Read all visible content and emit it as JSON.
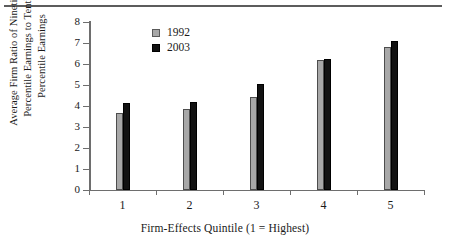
{
  "chart_data": {
    "type": "bar",
    "title": "",
    "xlabel": "Firm-Effects Quintile (1 = Highest)",
    "ylabel": "Average Firm Ratio of Ninetieth Percentile Earnings to Tenth Percentile Earnings",
    "ylabel_lines": [
      "Average Firm Ratio of Ninetieth",
      "Percentile Earnings to Tenth",
      "Percentile Earnings"
    ],
    "categories": [
      "1",
      "2",
      "3",
      "4",
      "5"
    ],
    "series": [
      {
        "name": "1992",
        "color": "#a8a8a8",
        "values": [
          3.65,
          3.85,
          4.45,
          6.18,
          6.82
        ]
      },
      {
        "name": "2003",
        "color": "#121212",
        "values": [
          4.15,
          4.2,
          5.05,
          6.25,
          7.08
        ]
      }
    ],
    "ylim": [
      0,
      8
    ],
    "ytick_labels": [
      "0",
      "1",
      "2",
      "3",
      "4",
      "5",
      "6",
      "7",
      "8"
    ],
    "ytick_values": [
      0,
      1,
      2,
      3,
      4,
      5,
      6,
      7,
      8
    ],
    "grid": false,
    "legend_position": "top-left-inside"
  },
  "legend": {
    "items": [
      {
        "label": "1992",
        "swatch": "gray-square"
      },
      {
        "label": "2003",
        "swatch": "black-square"
      }
    ]
  },
  "axes": {
    "x_title": "Firm-Effects Quintile (1 = Highest)"
  }
}
